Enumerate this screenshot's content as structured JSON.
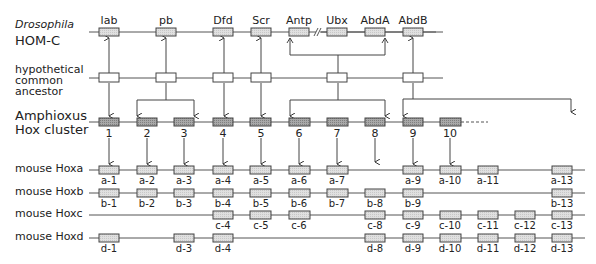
{
  "rows": {
    "drosophila": {
      "label_line1": "Drosophila",
      "label_line2": "HOM-C"
    },
    "ancestor": {
      "label_line1": "hypothetical",
      "label_line2": "common",
      "label_line3": "ancestor"
    },
    "amphioxus": {
      "label_line1": "Amphioxus",
      "label_line2": "Hox cluster"
    },
    "hoxa": {
      "label": "mouse Hoxa"
    },
    "hoxb": {
      "label": "mouse Hoxb"
    },
    "hoxc": {
      "label": "mouse Hoxc"
    },
    "hoxd": {
      "label": "mouse Hoxd"
    }
  },
  "drosophila_genes": [
    "lab",
    "pb",
    "Dfd",
    "Scr",
    "Antp",
    "Ubx",
    "AbdA",
    "AbdB"
  ],
  "amphioxus_genes": [
    "1",
    "2",
    "3",
    "4",
    "5",
    "6",
    "7",
    "8",
    "9",
    "10"
  ],
  "hoxa_genes": [
    "a-1",
    "a-2",
    "a-3",
    "a-4",
    "a-5",
    "a-6",
    "a-7",
    "a-9",
    "a-10",
    "a-11",
    "a-13"
  ],
  "hoxb_genes": [
    "b-1",
    "b-2",
    "b-3",
    "b-4",
    "b-5",
    "b-6",
    "b-7",
    "b-8",
    "b-9",
    "b-13"
  ],
  "hoxc_genes": [
    "c-4",
    "c-5",
    "c-6",
    "c-8",
    "c-9",
    "c-10",
    "c-11",
    "c-12",
    "c-13"
  ],
  "hoxd_genes": [
    "d-1",
    "d-3",
    "d-4",
    "d-8",
    "d-9",
    "d-10",
    "d-11",
    "d-12",
    "d-13"
  ],
  "colors": {
    "line": "#555555",
    "drosophila_box": "#e2e2e2",
    "amphioxus_box": "#9a9a9a",
    "mouse_box": "#e4e4e4",
    "ancestor_box": "#ffffff"
  }
}
